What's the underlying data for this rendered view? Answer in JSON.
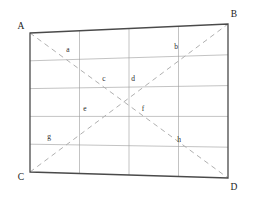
{
  "figure": {
    "type": "geometric-diagram",
    "canvas": {
      "width": 254,
      "height": 197,
      "background": "#ffffff"
    },
    "colors": {
      "outline": "#4a4a4a",
      "grid": "#9a9a9a",
      "diagonal": "#b0b0b0",
      "label": "#1a1a1a",
      "point_label": "#2b2b2b"
    },
    "strokes": {
      "outline_width": 1.3,
      "grid_width": 0.6,
      "diagonal_width": 1.0,
      "diagonal_dash": "5,4"
    },
    "corners": [
      {
        "name": "A",
        "x": 30,
        "y": 33,
        "label_x": 21,
        "label_y": 29
      },
      {
        "name": "B",
        "x": 228,
        "y": 24,
        "label_x": 234,
        "label_y": 17
      },
      {
        "name": "C",
        "x": 30,
        "y": 172,
        "label_x": 21,
        "label_y": 180
      },
      {
        "name": "D",
        "x": 228,
        "y": 178,
        "label_x": 234,
        "label_y": 190
      }
    ],
    "grid": {
      "columns": 4,
      "rows": 5,
      "vertical_fractions": [
        0.25,
        0.5,
        0.75
      ],
      "horizontal_fractions": [
        0.2,
        0.4,
        0.6,
        0.8
      ]
    },
    "diagonals": [
      {
        "name": "diagonal-A-D",
        "from": "A",
        "to": "D"
      },
      {
        "name": "diagonal-C-B",
        "from": "C",
        "to": "B"
      }
    ],
    "points": [
      {
        "name": "a",
        "label": "a",
        "x": 68,
        "y": 52
      },
      {
        "name": "b",
        "label": "b",
        "x": 176,
        "y": 49
      },
      {
        "name": "c",
        "label": "c",
        "x": 104,
        "y": 81
      },
      {
        "name": "d",
        "label": "d",
        "x": 133,
        "y": 81
      },
      {
        "name": "e",
        "label": "e",
        "x": 85,
        "y": 111
      },
      {
        "name": "f",
        "label": "f",
        "x": 143,
        "y": 111
      },
      {
        "name": "g",
        "label": "g",
        "x": 49,
        "y": 139
      },
      {
        "name": "h",
        "label": "h",
        "x": 179,
        "y": 142
      }
    ]
  }
}
